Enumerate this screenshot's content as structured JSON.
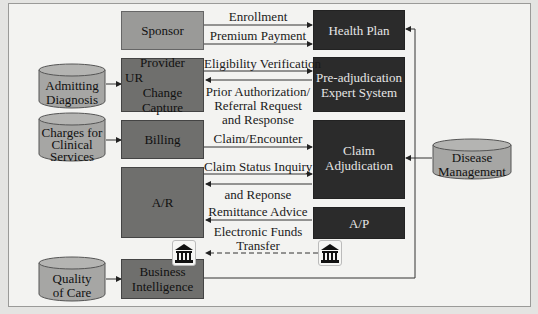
{
  "diagram": {
    "entities": {
      "sponsor": "Sponsor",
      "health_plan": "Health Plan",
      "provider": "Provider",
      "provider_sub1": "UR",
      "provider_sub2": "Change Capture",
      "pre_adj_1": "Pre-adjudication",
      "pre_adj_2": "Expert System",
      "billing": "Billing",
      "claim_adj_1": "Claim",
      "claim_adj_2": "Adjudication",
      "ar": "A/R",
      "ap": "A/P",
      "bi_1": "Business",
      "bi_2": "Intelligence"
    },
    "databases": {
      "admitting": [
        "Admitting",
        "Diagnosis"
      ],
      "charges": [
        "Charges for",
        "Clinical",
        "Services"
      ],
      "quality": [
        "Quality",
        "of Care"
      ],
      "disease": [
        "Disease",
        "Management"
      ]
    },
    "flows": {
      "enrollment": "Enrollment",
      "premium": "Premium Payment",
      "eligibility": "Eligibility Verification",
      "prior_auth_1": "Prior Authorization/",
      "prior_auth_2": "Referral Request",
      "prior_auth_3": "and Response",
      "claim_enc": "Claim/Encounter",
      "status_inq": "Claim Status Inquiry",
      "and_response": "and Reponse",
      "remittance": "Remittance Advice",
      "eft_1": "Electronic Funds",
      "eft_2": "Transfer"
    },
    "icons": [
      "bank-icon",
      "bank-icon"
    ],
    "colors": {
      "light_box": "#9a9a98",
      "mid_box": "#6f6f6d",
      "dark_box": "#2b2b2b",
      "background": "#f3f3f1"
    }
  }
}
